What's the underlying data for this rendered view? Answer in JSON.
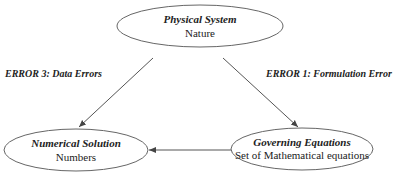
{
  "nodes": {
    "physical": {
      "title": "Physical System",
      "subtitle": "Nature"
    },
    "numerical": {
      "title": "Numerical Solution",
      "subtitle": "Numbers"
    },
    "governing": {
      "title": "Governing Equations",
      "subtitle": "Set of Mathematical equations"
    }
  },
  "edges": {
    "left_label": "ERROR 3: Data Errors",
    "right_label": "ERROR 1: Formulation Error"
  },
  "colors": {
    "stroke": "#555555",
    "text": "#222222"
  }
}
